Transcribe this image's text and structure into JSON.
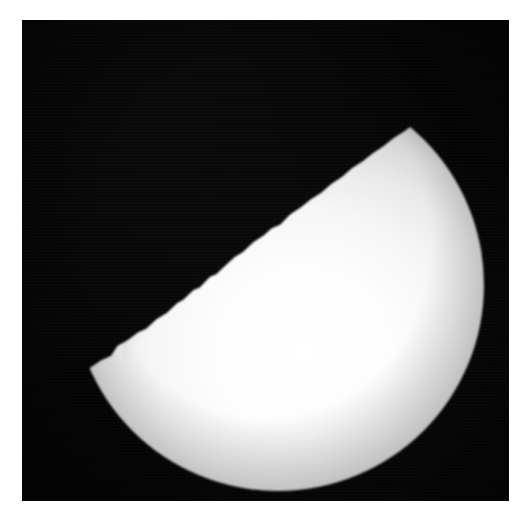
{
  "figure": {
    "title": "Gibbous phase photograph of the Moon",
    "kind": "astronomical-photograph",
    "medium": "black-and-white halftone print",
    "alt_text": "A black and white photograph showing a bright half-lit spherical body against a black sky. The illuminated portion occupies the lower right, bounded above by a slightly irregular terminator line running from upper right to lower left."
  },
  "canvas": {
    "width_px": 525,
    "height_px": 520,
    "page_background": "#ffffff"
  },
  "plate": {
    "label": "photographic plate",
    "left_px": 22,
    "top_px": 20,
    "width_px": 487,
    "height_px": 481,
    "sky_color": "#050505",
    "grain": "fine film grain with faint horizontal scan lines"
  },
  "body": {
    "label": "illuminated lunar disk",
    "phase": "gibbous",
    "disk_center_x_px": 278,
    "disk_center_y_px": 285,
    "disk_radius_px": 206,
    "limb_rightmost_x_px": 485,
    "limb_bottom_y_px": 451,
    "terminator": {
      "description": "irregular day-night boundary",
      "upper_right_cusp_x_px": 450,
      "upper_right_cusp_y_px": 138,
      "lower_left_cusp_x_px": 78,
      "lower_left_cusp_y_px": 355,
      "tilt_degrees": -30
    },
    "brightness": {
      "peak_color": "#ffffff",
      "midtone_color": "#e9e9e9",
      "terminator_edge_color": "#8a8a8a",
      "shadow_color": "#050505"
    }
  },
  "palette": {
    "white": "#ffffff",
    "near_black": "#050505",
    "highlight": "#fdfdfd",
    "light_gray": "#e9e9e9",
    "mid_gray": "#bdbdbd",
    "dark_gray": "#7d7d7d"
  }
}
